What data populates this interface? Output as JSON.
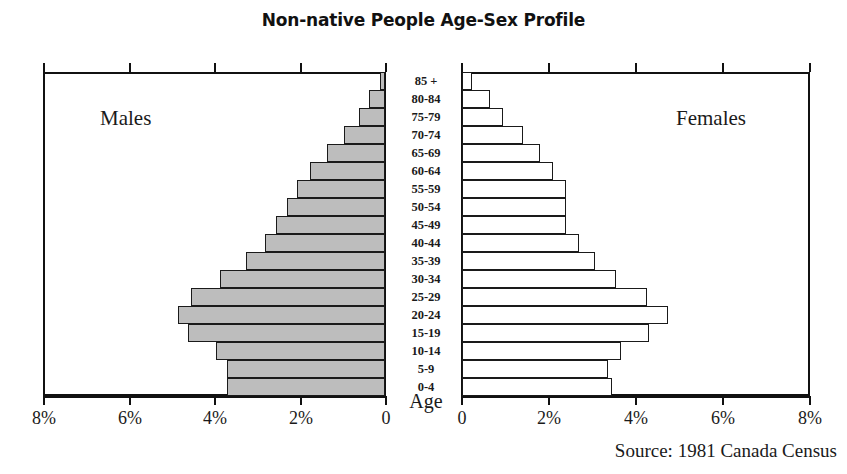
{
  "chart_data": {
    "type": "bar",
    "subtype": "population-pyramid",
    "title": "Non-native People Age-Sex Profile",
    "xlabel": "",
    "ylabel": "Age",
    "xlim": [
      0,
      8
    ],
    "grid": false,
    "legend_position": "in-plot",
    "source": "Source: 1981 Canada Census",
    "categories": [
      "85 +",
      "80-84",
      "75-79",
      "70-74",
      "65-69",
      "60-64",
      "55-59",
      "50-54",
      "45-49",
      "40-44",
      "35-39",
      "30-34",
      "25-29",
      "20-24",
      "15-19",
      "10-14",
      "5-9",
      "0-4"
    ],
    "series": [
      {
        "name": "Males",
        "unit": "%",
        "values": [
          0.12,
          0.38,
          0.62,
          0.95,
          1.35,
          1.75,
          2.05,
          2.3,
          2.55,
          2.8,
          3.25,
          3.85,
          4.55,
          4.85,
          4.6,
          3.95,
          3.7,
          3.7
        ]
      },
      {
        "name": "Females",
        "unit": "%",
        "values": [
          0.22,
          0.65,
          0.95,
          1.4,
          1.8,
          2.1,
          2.4,
          2.4,
          2.4,
          2.7,
          3.05,
          3.55,
          4.25,
          4.74,
          4.3,
          3.65,
          3.35,
          3.45
        ]
      }
    ],
    "axis_ticks_males": [
      "8%",
      "6%",
      "4%",
      "2%",
      "0"
    ],
    "axis_ticks_females": [
      "0",
      "2%",
      "4%",
      "6%",
      "8%"
    ],
    "colors": {
      "male_fill": "#bdbdbd",
      "female_fill": "#ffffff",
      "outline": "#1a1a1a",
      "background": "#ffffff"
    }
  },
  "labels": {
    "males": "Males",
    "females": "Females",
    "age_axis": "Age"
  }
}
